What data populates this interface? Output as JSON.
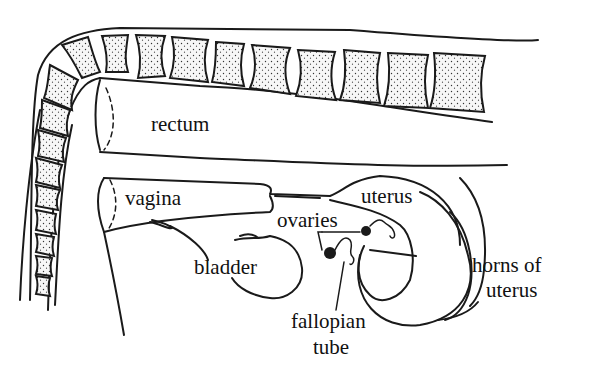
{
  "diagram": {
    "labels": {
      "rectum": "rectum",
      "vagina": "vagina",
      "uterus": "uterus",
      "ovaries": "ovaries",
      "bladder": "bladder",
      "horns_of_uterus_line1": "horns of",
      "horns_of_uterus_line2": "uterus",
      "fallopian_tube_line1": "fallopian",
      "fallopian_tube_line2": "tube"
    },
    "colors": {
      "line": "#1a1a1a",
      "background": "#ffffff",
      "vertebra_fill": "#f4f4f4"
    }
  }
}
